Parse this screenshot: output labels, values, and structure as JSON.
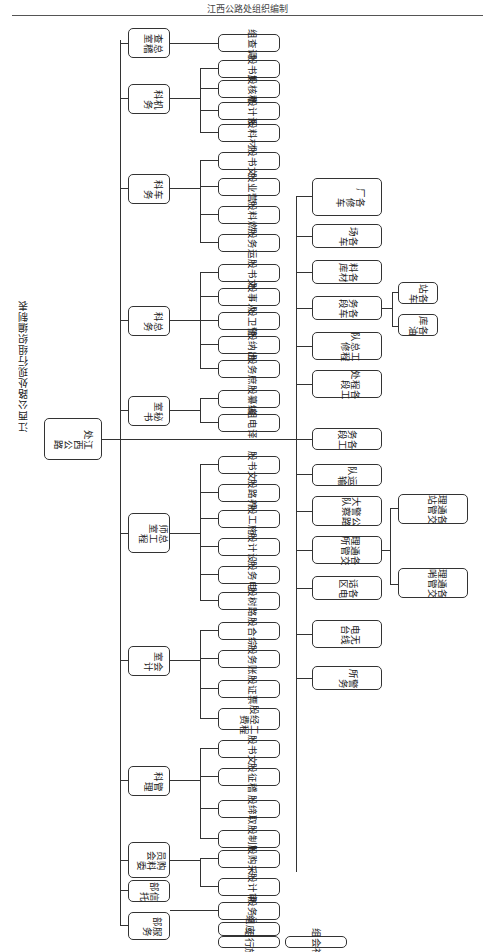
{
  "header": {
    "text": "江西公路处组织编制"
  },
  "title": "江西公路处现行组织编制表",
  "root": {
    "label": "江西公路处"
  },
  "level1": [
    {
      "label": "总稽查室",
      "children": [
        "调查组"
      ]
    },
    {
      "label": "机务科",
      "children": [
        "文书股",
        "稽核股",
        "设计股",
        "材料股"
      ]
    },
    {
      "label": "车务科",
      "children": [
        "文书股",
        "营业股",
        "燃料股",
        "运务股"
      ]
    },
    {
      "label": "总务科",
      "children": [
        "文书股",
        "人事股",
        "警卫股",
        "出纳股",
        "庶务股"
      ]
    },
    {
      "label": "秘书室",
      "children": [
        "编纂股",
        "译电组"
      ]
    },
    {
      "label": "总工程师室",
      "children": [
        "文书股",
        "养路股",
        "施工股",
        "设计股",
        "电务股",
        "路树股"
      ]
    },
    {
      "label": "会计室",
      "children": [
        "综合股",
        "账务股",
        "票证股",
        "工程经费股"
      ]
    },
    {
      "label": "管理科",
      "children": [
        "文书股",
        "稽征股",
        "取缔股",
        "管制股"
      ]
    },
    {
      "label": "购料委员会",
      "children": [
        "采购股",
        "审计股"
      ]
    },
    {
      "label": "信托部",
      "children": [
        "运务股"
      ]
    },
    {
      "label": "服务部",
      "children": [
        "供应组",
        "旅行组",
        "社会组"
      ]
    }
  ],
  "right_branch": [
    {
      "label": "各修车厂"
    },
    {
      "label": "各车场"
    },
    {
      "label": "各材料库"
    },
    {
      "label": "各车务段",
      "children": [
        "各车站",
        "各油库"
      ]
    },
    {
      "label": "工程总修队"
    },
    {
      "label": "各工程段处"
    },
    {
      "label": "各工务段"
    },
    {
      "label": "运输队"
    },
    {
      "label": "公路警察大队"
    },
    {
      "label": "各交通管理所",
      "children": [
        "各交通管理站",
        "各交通管理哨"
      ]
    },
    {
      "label": "各电话区"
    },
    {
      "label": "无线电台"
    },
    {
      "label": "警务所"
    }
  ]
}
